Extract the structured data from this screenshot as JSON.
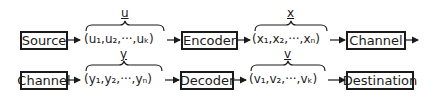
{
  "diagram": {
    "row1": {
      "blocks": [
        "Source",
        "Encoder",
        "Channel"
      ],
      "seq_u": {
        "label": "u",
        "text": "(u₁,u₂,···,uₖ)"
      },
      "seq_x": {
        "label": "x",
        "text": "(x₁,x₂,···,xₙ)"
      }
    },
    "row2": {
      "blocks": [
        "Channel",
        "Decoder",
        "Destination"
      ],
      "seq_y": {
        "label": "y",
        "text": "(y₁,y₂,···,yₙ)"
      },
      "seq_v": {
        "label": "v",
        "text": "(v₁,v₂,···,vₖ)"
      }
    }
  }
}
